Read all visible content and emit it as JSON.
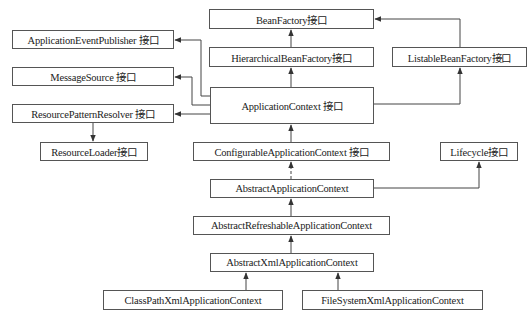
{
  "diagram": {
    "title": "",
    "nodes": [
      {
        "id": "bean-factory",
        "label": "BeanFactory接口",
        "x": 209,
        "y": 9,
        "w": 165,
        "h": 20
      },
      {
        "id": "application-event-publisher",
        "label": "ApplicationEventPublisher 接口",
        "x": 12,
        "y": 30,
        "w": 162,
        "h": 19
      },
      {
        "id": "hierarchical-bean-factory",
        "label": "HierarchicalBeanFactory接口",
        "x": 209,
        "y": 47,
        "w": 165,
        "h": 20
      },
      {
        "id": "listable-bean-factory",
        "label": "ListableBeanFactory接口",
        "x": 392,
        "y": 47,
        "w": 135,
        "h": 20
      },
      {
        "id": "message-source",
        "label": "MessageSource 接口",
        "x": 12,
        "y": 67,
        "w": 162,
        "h": 19
      },
      {
        "id": "application-context",
        "label": "ApplicationContext 接口",
        "x": 210,
        "y": 87,
        "w": 164,
        "h": 37
      },
      {
        "id": "resource-pattern-resolver",
        "label": "ResourcePatternResolver 接口",
        "x": 12,
        "y": 104,
        "w": 162,
        "h": 19
      },
      {
        "id": "resource-loader",
        "label": "ResourceLoader接口",
        "x": 40,
        "y": 142,
        "w": 108,
        "h": 19
      },
      {
        "id": "configurable-application-context",
        "label": "ConfigurableApplicationContext 接口",
        "x": 193,
        "y": 142,
        "w": 197,
        "h": 19
      },
      {
        "id": "lifecycle",
        "label": "Lifecycle接口",
        "x": 440,
        "y": 142,
        "w": 78,
        "h": 19
      },
      {
        "id": "abstract-application-context",
        "label": "AbstractApplicationContext",
        "x": 210,
        "y": 179,
        "w": 164,
        "h": 19
      },
      {
        "id": "abstract-refreshable-application-context",
        "label": "AbstractRefreshableApplicationContext",
        "x": 193,
        "y": 216,
        "w": 197,
        "h": 19
      },
      {
        "id": "abstract-xml-application-context",
        "label": "AbstractXmlApplicationContext",
        "x": 210,
        "y": 253,
        "w": 164,
        "h": 19
      },
      {
        "id": "class-path-xml-application-context",
        "label": "ClassPathXmlApplicationContext",
        "x": 103,
        "y": 290,
        "w": 180,
        "h": 20
      },
      {
        "id": "file-system-xml-application-context",
        "label": "FileSystemXmlApplicationContext",
        "x": 302,
        "y": 290,
        "w": 181,
        "h": 20
      }
    ],
    "edges": [
      {
        "from": "hierarchical-bean-factory",
        "to": "bean-factory",
        "style": "solid",
        "points": [
          [
            291,
            47
          ],
          [
            291,
            30
          ]
        ]
      },
      {
        "from": "listable-bean-factory",
        "to": "bean-factory",
        "style": "solid",
        "points": [
          [
            460,
            47
          ],
          [
            460,
            19
          ],
          [
            375,
            19
          ]
        ]
      },
      {
        "from": "application-context",
        "to": "hierarchical-bean-factory",
        "style": "solid",
        "points": [
          [
            291,
            87
          ],
          [
            291,
            68
          ]
        ]
      },
      {
        "from": "application-context",
        "to": "listable-bean-factory",
        "style": "solid",
        "points": [
          [
            374,
            104
          ],
          [
            460,
            104
          ],
          [
            460,
            68
          ]
        ]
      },
      {
        "from": "application-context",
        "to": "application-event-publisher",
        "style": "solid",
        "points": [
          [
            210,
            96
          ],
          [
            201,
            96
          ],
          [
            201,
            40
          ],
          [
            175,
            40
          ]
        ]
      },
      {
        "from": "application-context",
        "to": "message-source",
        "style": "solid",
        "points": [
          [
            210,
            105
          ],
          [
            192,
            105
          ],
          [
            192,
            77
          ],
          [
            175,
            77
          ]
        ]
      },
      {
        "from": "application-context",
        "to": "resource-pattern-resolver",
        "style": "solid",
        "points": [
          [
            210,
            114
          ],
          [
            175,
            114
          ]
        ]
      },
      {
        "from": "resource-pattern-resolver",
        "to": "resource-loader",
        "style": "solid",
        "points": [
          [
            93,
            123
          ],
          [
            93,
            141
          ]
        ]
      },
      {
        "from": "configurable-application-context",
        "to": "application-context",
        "style": "solid",
        "points": [
          [
            291,
            142
          ],
          [
            291,
            125
          ]
        ]
      },
      {
        "from": "abstract-application-context",
        "to": "configurable-application-context",
        "style": "dashed",
        "points": [
          [
            291,
            179
          ],
          [
            291,
            162
          ]
        ]
      },
      {
        "from": "abstract-application-context",
        "to": "lifecycle",
        "style": "solid",
        "points": [
          [
            374,
            188
          ],
          [
            479,
            188
          ],
          [
            479,
            162
          ]
        ]
      },
      {
        "from": "abstract-refreshable-application-context",
        "to": "abstract-application-context",
        "style": "solid",
        "points": [
          [
            291,
            216
          ],
          [
            291,
            199
          ]
        ]
      },
      {
        "from": "abstract-xml-application-context",
        "to": "abstract-refreshable-application-context",
        "style": "solid",
        "points": [
          [
            291,
            253
          ],
          [
            291,
            236
          ]
        ]
      },
      {
        "from": "class-path-xml-application-context",
        "to": "abstract-xml-application-context",
        "style": "solid",
        "points": [
          [
            246,
            290
          ],
          [
            246,
            273
          ]
        ]
      },
      {
        "from": "file-system-xml-application-context",
        "to": "abstract-xml-application-context",
        "style": "solid",
        "points": [
          [
            338,
            290
          ],
          [
            338,
            273
          ]
        ]
      }
    ],
    "colors": {
      "line": "#444444",
      "border": "#555555",
      "text": "#222222"
    }
  }
}
